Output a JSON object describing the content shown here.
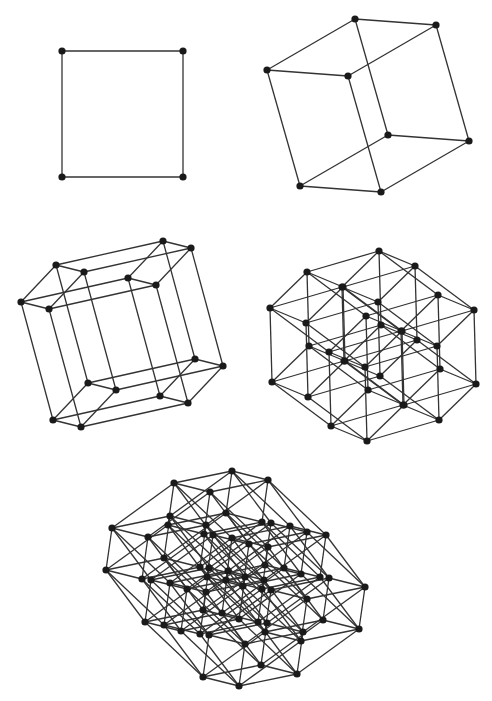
{
  "figure": {
    "colors": {
      "edge": "#333333",
      "vertex": "#1a1a1a",
      "background": "#ffffff"
    },
    "edge_width": 1.3,
    "vertex_radius": 3.6,
    "panels": [
      {
        "name": "square-2d",
        "dimension": 2,
        "origin": [
          62,
          177
        ],
        "basis": [
          [
            121,
            0
          ],
          [
            0,
            -126
          ]
        ]
      },
      {
        "name": "cube-3d",
        "dimension": 3,
        "origin": [
          300,
          186
        ],
        "basis": [
          [
            81,
            6
          ],
          [
            88,
            -51
          ],
          [
            -33,
            -116
          ]
        ]
      },
      {
        "name": "tesseract-4d",
        "dimension": 4,
        "origin": [
          53,
          420
        ],
        "basis": [
          [
            28,
            7
          ],
          [
            35,
            -37
          ],
          [
            107,
            -24
          ],
          [
            -32,
            -118
          ]
        ]
      },
      {
        "name": "penteract-5d",
        "dimension": 5,
        "origin": [
          367,
          441
        ],
        "basis": [
          [
            -36,
            -15
          ],
          [
            72,
            -21
          ],
          [
            37,
            -36
          ],
          [
            -59,
            -44
          ],
          [
            -2,
            -74
          ]
        ]
      },
      {
        "name": "hexeract-6d",
        "dimension": 6,
        "origin": [
          239,
          686
        ],
        "basis": [
          [
            -36,
            -9
          ],
          [
            58,
            -12
          ],
          [
            -58,
            -55
          ],
          [
            6,
            -42
          ],
          [
            62,
            -45
          ],
          [
            -39,
            -52
          ]
        ]
      }
    ]
  }
}
